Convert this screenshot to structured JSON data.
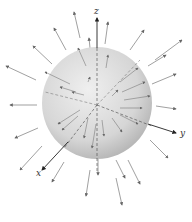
{
  "diagram": {
    "type": "radial vector field on sphere",
    "axes": {
      "x": "x",
      "y": "y",
      "z": "z"
    },
    "colors": {
      "sphere_light": "#ececec",
      "sphere_dark": "#b9b9b9",
      "arrow": "#666666",
      "axis": "#222222"
    }
  }
}
